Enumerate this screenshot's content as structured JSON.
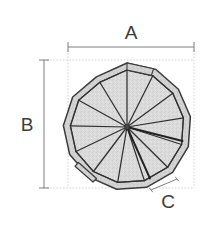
{
  "drawing": {
    "title": "Spiral staircase plan view with dimensions",
    "background_color": "#ffffff",
    "line_color": "#3a3a3a",
    "thin_line_color": "#9a9a9a",
    "fill_color": "#d9d9d9",
    "rim_fill_color": "#cfcfcf",
    "labels": {
      "a": "A",
      "b": "B",
      "c": "C"
    },
    "dimensions": [
      {
        "name": "A",
        "label": "A",
        "orientation": "horizontal",
        "x1": 68,
        "y1": 47,
        "x2": 194,
        "y2": 47,
        "label_x": 131,
        "label_y": 39
      },
      {
        "name": "B",
        "label": "B",
        "orientation": "vertical",
        "x1": 44,
        "y1": 60,
        "x2": 44,
        "y2": 188,
        "label_x": 27,
        "label_y": 131
      },
      {
        "name": "C",
        "label": "C",
        "orientation": "diagonal",
        "x1": 151,
        "y1": 190,
        "x2": 177,
        "y2": 179,
        "label_x": 168,
        "label_y": 208
      }
    ],
    "body": {
      "shape": "tredecagon",
      "sides": 13,
      "center_x": 127,
      "center_y": 127,
      "outer_radius": 64,
      "inner_radius": 57,
      "hub_radius": 3,
      "treads": 13
    }
  }
}
